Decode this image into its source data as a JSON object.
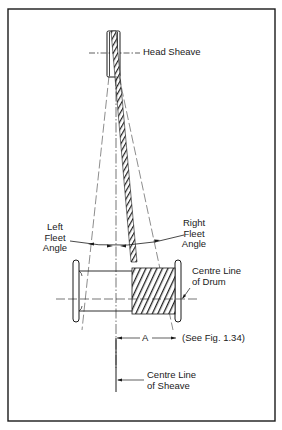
{
  "diagram": {
    "type": "fleet-angle-illustration",
    "colors": {
      "ink": "#1a1a1a",
      "background": "#ffffff",
      "rope": "#333333"
    },
    "labels": {
      "head_sheave": "Head Sheave",
      "left_fleet_angle": [
        "Left",
        "Fleet",
        "Angle"
      ],
      "right_fleet_angle": [
        "Right",
        "Fleet",
        "Angle"
      ],
      "centre_line_drum": [
        "Centre Line",
        "of Drum"
      ],
      "dimension_a": "A",
      "see_fig": "(See Fig. 1.34)",
      "centre_line_sheave": [
        "Centre Line",
        "of Sheave"
      ]
    }
  }
}
